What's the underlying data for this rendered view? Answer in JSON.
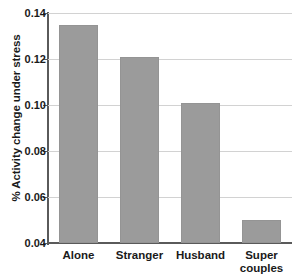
{
  "chart_data": {
    "type": "bar",
    "title": "",
    "subtitle": "",
    "xlabel": "",
    "ylabel": "% Activity change under stress",
    "categories": [
      "Alone",
      "Stranger",
      "Husband",
      "Super couples"
    ],
    "category_lines": [
      [
        "Alone"
      ],
      [
        "Stranger"
      ],
      [
        "Husband"
      ],
      [
        "Super",
        "couples"
      ]
    ],
    "values": [
      0.135,
      0.121,
      0.101,
      0.05
    ],
    "ylim": [
      0.04,
      0.14
    ],
    "ytick_values": [
      0.04,
      0.06,
      0.08,
      0.1,
      0.12,
      0.14
    ],
    "ytick_labels": [
      "0.04",
      "0.06",
      "0.08",
      "0.10",
      "0.12",
      "0.14"
    ],
    "grid": true,
    "legend": false,
    "legend_position": "none",
    "bar_color": "#9b9b9b",
    "grid_color": "#d2d2d2",
    "axis_color": "#5a5a5a",
    "background_color": "#ffffff"
  }
}
